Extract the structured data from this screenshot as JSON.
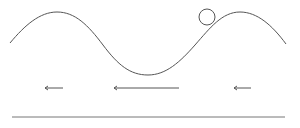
{
  "diagram": {
    "stroke_color": "#555555",
    "background": "#ffffff",
    "wave": {
      "path": "M 10 43 C 25 25, 40 12, 57 12 C 75 12, 88 25, 103 45 C 118 65, 130 75, 148 75 C 166 75, 180 62, 195 45 C 210 28, 222 12, 240 12 C 257 12, 272 25, 286 44"
    },
    "ball": {
      "cx": 207,
      "cy": 17,
      "r": 8
    },
    "arrows": [
      {
        "x1": 63,
        "x2": 45,
        "y": 88,
        "direction": "left"
      },
      {
        "x1": 179,
        "x2": 114,
        "y": 88,
        "direction": "left"
      },
      {
        "x1": 251,
        "x2": 234,
        "y": 88,
        "direction": "left"
      }
    ],
    "baseline": {
      "x1": 12,
      "x2": 285,
      "y": 117
    }
  }
}
